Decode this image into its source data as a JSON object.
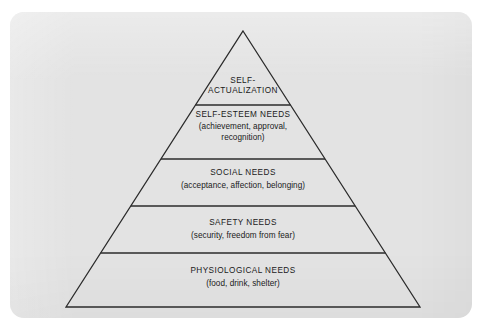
{
  "figure": {
    "kind": "pyramid-diagram",
    "card_background": "#e3e3e3",
    "page_background": "#ffffff",
    "stroke_color": "#2b2b2b",
    "text_color": "#1a1a1a"
  },
  "pyramid": {
    "apex": {
      "x": 243,
      "y": 31
    },
    "base_left": {
      "x": 66,
      "y": 307
    },
    "base_right": {
      "x": 420,
      "y": 307
    },
    "divider_y": [
      105,
      159,
      206,
      253
    ],
    "tiers": [
      {
        "id": "self-actualization",
        "level": 1,
        "title_line_1": "SELF-",
        "title_line_2": "ACTUALIZATION",
        "subtitle": ""
      },
      {
        "id": "self-esteem",
        "level": 2,
        "title_line_1": "SELF-ESTEEM NEEDS",
        "title_line_2": "",
        "subtitle_line_1": "(achievement, approval,",
        "subtitle_line_2": "recognition)"
      },
      {
        "id": "social",
        "level": 3,
        "title_line_1": "SOCIAL NEEDS",
        "title_line_2": "",
        "subtitle_line_1": "(acceptance, affection, belonging)",
        "subtitle_line_2": ""
      },
      {
        "id": "safety",
        "level": 4,
        "title_line_1": "SAFETY NEEDS",
        "title_line_2": "",
        "subtitle_line_1": "(security, freedom from fear)",
        "subtitle_line_2": ""
      },
      {
        "id": "physiological",
        "level": 5,
        "title_line_1": "PHYSIOLOGICAL NEEDS",
        "title_line_2": "",
        "subtitle_line_1": "(food, drink, shelter)",
        "subtitle_line_2": ""
      }
    ]
  }
}
